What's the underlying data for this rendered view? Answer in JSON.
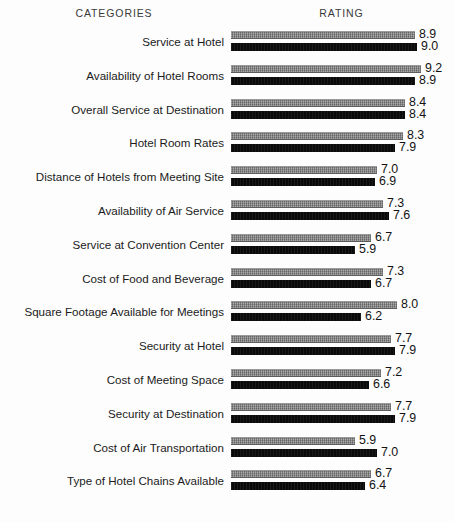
{
  "header": {
    "categories_label": "CATEGORIES",
    "rating_label": "RATING"
  },
  "chart_data": {
    "type": "bar",
    "orientation": "horizontal",
    "title": "",
    "subtitle": "",
    "xlabel": "RATING",
    "ylabel": "CATEGORIES",
    "grid": false,
    "legend": "none",
    "xlim": [
      0,
      10
    ],
    "value_axis_start": -0.3,
    "px_per_unit": 20,
    "categories": [
      "Service at Hotel",
      "Availability of Hotel Rooms",
      "Overall Service at Destination",
      "Hotel Room Rates",
      "Distance of Hotels from Meeting Site",
      "Availability of Air Service",
      "Service at Convention Center",
      "Cost of Food and Beverage",
      "Square Footage Available for Meetings",
      "Security at Hotel",
      "Cost of Meeting Space",
      "Security at Destination",
      "Cost of Air Transportation",
      "Type of Hotel Chains Available"
    ],
    "series": [
      {
        "name": "gray-series",
        "color": "#7b7b7b",
        "values": [
          8.9,
          9.2,
          8.4,
          8.3,
          7.0,
          7.3,
          6.7,
          7.3,
          8.0,
          7.7,
          7.2,
          7.7,
          5.9,
          6.7
        ]
      },
      {
        "name": "black-series",
        "color": "#0d0d0d",
        "values": [
          9.0,
          8.9,
          8.4,
          7.9,
          6.9,
          7.6,
          5.9,
          6.7,
          6.2,
          7.9,
          6.6,
          7.9,
          7.0,
          6.4
        ]
      }
    ],
    "value_labels": {
      "gray": [
        "8.9",
        "9.2",
        "8.4",
        "8.3",
        "7.0",
        "7.3",
        "6.7",
        "7.3",
        "8.0",
        "7.7",
        "7.2",
        "7.7",
        "5.9",
        "6.7"
      ],
      "black": [
        "9.0",
        "8.9",
        "8.4",
        "7.9",
        "6.9",
        "7.6",
        "5.9",
        "6.7",
        "6.2",
        "7.9",
        "6.6",
        "7.9",
        "7.0",
        "6.4"
      ]
    }
  }
}
